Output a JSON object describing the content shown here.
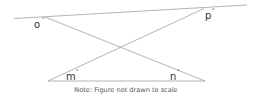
{
  "figure": {
    "angle_labels": {
      "o": "o",
      "p": "p",
      "m": "m",
      "n": "n",
      "degree": "°"
    },
    "note": "Note: Figure not drawn to scale",
    "line_color": "#9a9a9a"
  }
}
